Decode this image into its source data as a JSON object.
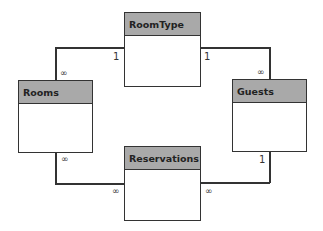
{
  "diagram": {
    "type": "entity-relationship",
    "entities": [
      {
        "id": "roomtype",
        "label": "RoomType"
      },
      {
        "id": "rooms",
        "label": "Rooms"
      },
      {
        "id": "guests",
        "label": "Guests"
      },
      {
        "id": "reservations",
        "label": "Reservations"
      }
    ],
    "relationships": [
      {
        "from": "RoomType",
        "to": "Rooms",
        "from_card": "1",
        "to_card": "∞"
      },
      {
        "from": "RoomType",
        "to": "Guests",
        "from_card": "1",
        "to_card": "∞"
      },
      {
        "from": "Rooms",
        "to": "Reservations",
        "from_card": "∞",
        "to_card": "∞"
      },
      {
        "from": "Guests",
        "to": "Reservations",
        "from_card": "1",
        "to_card": "∞"
      }
    ],
    "colors": {
      "header": "#a9a9a9",
      "border": "#333333",
      "body": "#ffffff"
    }
  },
  "labels": {
    "rt_rooms_one": "1",
    "rt_rooms_many": "∞",
    "rt_guests_one": "1",
    "rt_guests_many": "∞",
    "rooms_res_many_a": "∞",
    "rooms_res_many_b": "∞",
    "guests_res_one": "1",
    "guests_res_many": "∞"
  }
}
